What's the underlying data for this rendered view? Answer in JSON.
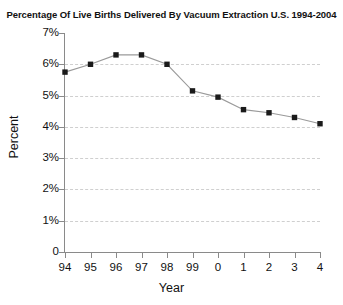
{
  "chart_data": {
    "type": "line",
    "title": "Percentage Of Live Births Delivered By Vacuum Extraction U.S. 1994-2004",
    "xlabel": "Year",
    "ylabel": "Percent",
    "categories": [
      "94",
      "95",
      "96",
      "97",
      "98",
      "99",
      "0",
      "1",
      "2",
      "3",
      "4"
    ],
    "values": [
      5.75,
      6.0,
      6.3,
      6.3,
      6.0,
      5.15,
      4.95,
      4.55,
      4.45,
      4.3,
      4.1
    ],
    "series": [
      {
        "name": "Percent of live births delivered by vacuum extraction",
        "values": [
          5.75,
          6.0,
          6.3,
          6.3,
          6.0,
          5.15,
          4.95,
          4.55,
          4.45,
          4.3,
          4.1
        ]
      }
    ],
    "ylim": [
      0,
      7
    ],
    "ytick_values": [
      0,
      1,
      2,
      3,
      4,
      5,
      6,
      7
    ],
    "ytick_labels": [
      "0",
      "1%",
      "2%",
      "3%",
      "4%",
      "5%",
      "6%",
      "7%"
    ],
    "xtick_labels": [
      "94",
      "95",
      "96",
      "97",
      "98",
      "99",
      "0",
      "1",
      "2",
      "3",
      "4"
    ],
    "grid": "horizontal-dashed",
    "legend": "none",
    "marker": "square",
    "marker_color": "#1a1a1a",
    "line_color": "#9a9a9a",
    "grid_color": "#cfcfcf",
    "axis_color": "#8a8a8a",
    "background": "#ffffff"
  }
}
